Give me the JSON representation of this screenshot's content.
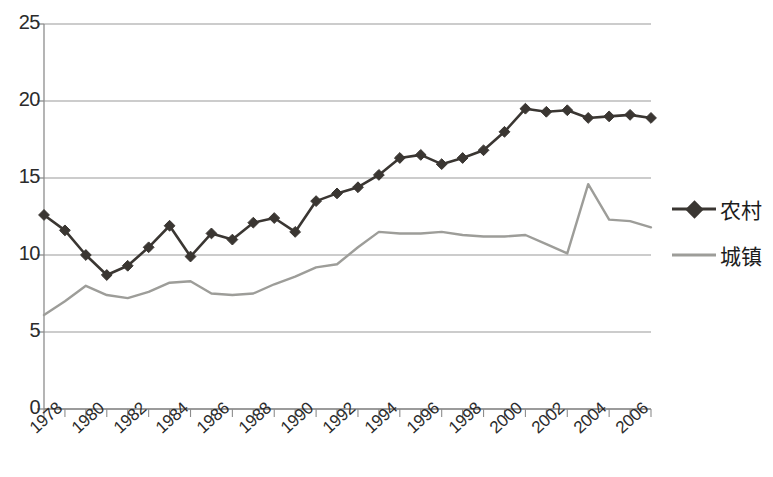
{
  "chart_data": {
    "type": "line",
    "title": "",
    "subtitle": "",
    "xlabel": "",
    "ylabel": "",
    "grid": true,
    "legend_position": "right",
    "ylim": [
      0,
      25
    ],
    "ytick_labels": [
      "25",
      "20",
      "15",
      "10",
      "5",
      "0"
    ],
    "ytick_values": [
      25,
      20,
      15,
      10,
      5,
      0
    ],
    "xlim": [
      1978,
      2007
    ],
    "x": [
      1978,
      1979,
      1980,
      1981,
      1982,
      1983,
      1984,
      1985,
      1986,
      1987,
      1988,
      1989,
      1990,
      1991,
      1992,
      1993,
      1994,
      1995,
      1996,
      1997,
      1998,
      1999,
      2000,
      2001,
      2002,
      2003,
      2004,
      2005,
      2006,
      2007
    ],
    "xtick_labels": [
      "1978",
      "1980",
      "1982",
      "1984",
      "1986",
      "1988",
      "1990",
      "1992",
      "1994",
      "1996",
      "1998",
      "2000",
      "2002",
      "2004",
      "2006"
    ],
    "xtick_values": [
      1978,
      1980,
      1982,
      1984,
      1986,
      1988,
      1990,
      1992,
      1994,
      1996,
      1998,
      2000,
      2002,
      2004,
      2006
    ],
    "series": [
      {
        "name": "农村",
        "color": "#3a3632",
        "marker": "diamond",
        "values": [
          12.6,
          11.6,
          10.0,
          8.7,
          9.3,
          10.5,
          11.9,
          9.9,
          11.4,
          11.0,
          12.1,
          12.4,
          11.5,
          13.5,
          14.0,
          14.4,
          15.2,
          16.3,
          16.5,
          15.9,
          16.3,
          16.8,
          18.0,
          19.5,
          19.3,
          19.4,
          18.9,
          19.0,
          19.1,
          18.9
        ]
      },
      {
        "name": "城镇",
        "color": "#9d9d99",
        "marker": "none",
        "values": [
          6.1,
          7.0,
          8.0,
          7.4,
          7.2,
          7.6,
          8.2,
          8.3,
          7.5,
          7.4,
          7.5,
          8.1,
          8.6,
          9.2,
          9.4,
          10.5,
          11.5,
          11.4,
          11.4,
          11.5,
          11.3,
          11.2,
          11.2,
          11.3,
          10.7,
          10.1,
          14.6,
          12.3,
          12.2,
          11.8
        ]
      }
    ]
  },
  "legend": {
    "entries": [
      {
        "label": "农村",
        "style": "line-marker",
        "color": "#3a3632"
      },
      {
        "label": "城镇",
        "style": "line",
        "color": "#9d9d99"
      }
    ]
  },
  "axis": {
    "y_axis_name": "value-axis",
    "x_axis_name": "year-axis"
  }
}
